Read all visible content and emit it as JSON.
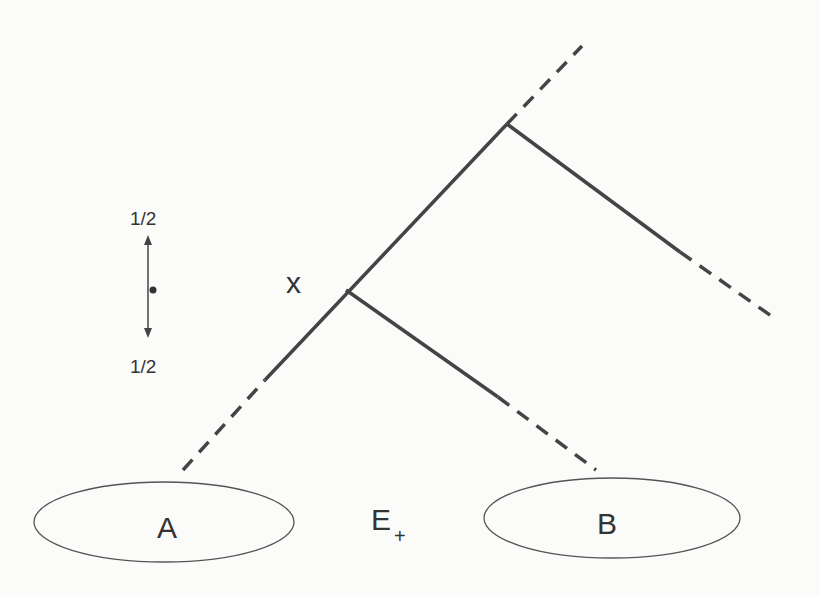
{
  "diagram": {
    "colors": {
      "line": "#444444",
      "text": "#333333",
      "background": "#fbfbfa"
    },
    "labels": {
      "half_top": "1/2",
      "half_bottom": "1/2",
      "point_x": "x",
      "region_a": "A",
      "region_b": "B",
      "region_e": "E",
      "region_e_subscript": "+"
    }
  }
}
